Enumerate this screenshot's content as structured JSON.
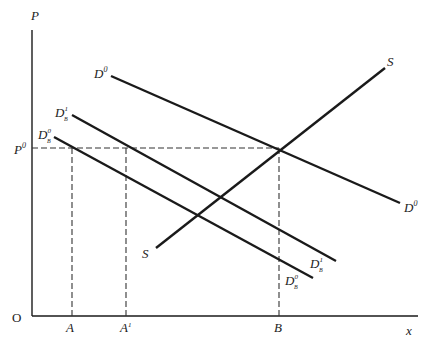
{
  "diagram": {
    "axes": {
      "y_label": "P",
      "x_label": "x",
      "origin_label": "O"
    },
    "price_level": {
      "label": "P",
      "superscript": "0"
    },
    "x_ticks": [
      {
        "id": "A",
        "label": "A",
        "superscript": ""
      },
      {
        "id": "A1",
        "label": "A",
        "superscript": "1"
      },
      {
        "id": "B",
        "label": "B",
        "superscript": ""
      }
    ],
    "curves": [
      {
        "id": "D0",
        "label": "D",
        "superscript": "0",
        "subscript": ""
      },
      {
        "id": "D1B",
        "label": "D",
        "superscript": "1",
        "subscript": "B"
      },
      {
        "id": "D0B",
        "label": "D",
        "superscript": "0",
        "subscript": "B"
      },
      {
        "id": "S",
        "label": "S",
        "superscript": "",
        "subscript": ""
      }
    ]
  }
}
